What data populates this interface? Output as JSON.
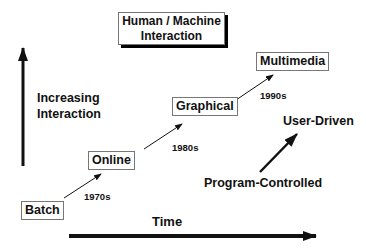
{
  "title": {
    "line1": "Human / Machine",
    "line2": "Interaction"
  },
  "y_axis": {
    "label_line1": "Increasing",
    "label_line2": "Interaction"
  },
  "x_axis": {
    "label": "Time"
  },
  "stages": [
    {
      "label": "Batch"
    },
    {
      "label": "Online"
    },
    {
      "label": "Graphical"
    },
    {
      "label": "Multimedia"
    }
  ],
  "transitions": [
    {
      "label": "1970s"
    },
    {
      "label": "1980s"
    },
    {
      "label": "1990s"
    }
  ],
  "control_shift": {
    "from": "Program-Controlled",
    "to": "User-Driven"
  }
}
